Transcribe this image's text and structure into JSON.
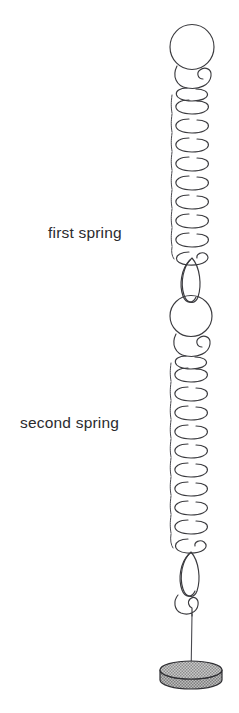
{
  "figure": {
    "background_color": "#ffffff",
    "line_color": "#3b3b3f",
    "labels": {
      "first_spring": "first spring",
      "second_spring": "second spring"
    },
    "label_positions": {
      "first_spring": {
        "x": 48,
        "y": 238
      },
      "second_spring": {
        "x": 20,
        "y": 428
      }
    },
    "components": {
      "top_loop": {
        "name": "top suspension loop",
        "center_x": 192,
        "center_y": 47,
        "radius_x": 22,
        "radius_y": 22
      },
      "first_spring": {
        "name": "first spring",
        "coil_count": 9,
        "top_y": 88,
        "bottom_y": 262,
        "center_x": 192,
        "coil_radius_x": 20,
        "coil_radius_y": 9.5,
        "pitch": 20
      },
      "middle_connector": {
        "name": "connector between springs",
        "eye_top_y": 258,
        "eye_bottom_y": 300,
        "eye_width": 10,
        "ring_center_y": 316,
        "ring_radius": 21
      },
      "second_spring": {
        "name": "second spring",
        "coil_count": 10,
        "top_y": 356,
        "bottom_y": 556,
        "center_x": 192,
        "coil_radius_x": 20,
        "coil_radius_y": 9.5,
        "pitch": 20
      },
      "bottom_connector": {
        "name": "bottom hook and wire",
        "eye_top_y": 552,
        "eye_bottom_y": 594,
        "hook_y": 606,
        "wire_top_y": 614,
        "wire_bottom_y": 676
      },
      "mass_disk": {
        "name": "hanging mass disk",
        "center_x": 191,
        "top_ellipse_y": 670,
        "radius_x": 31,
        "radius_y": 9,
        "thickness": 13,
        "fill_color": "#b9b9b9",
        "edge_color": "#2e2e32",
        "pattern": "stipple"
      }
    }
  }
}
